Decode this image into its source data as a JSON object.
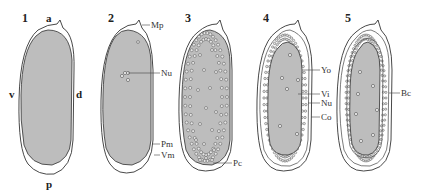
{
  "figure": {
    "panels": [
      {
        "number": "1",
        "axis_labels": {
          "anterior": "a",
          "posterior": "p",
          "ventral": "v",
          "dorsal": "d"
        },
        "labels": []
      },
      {
        "number": "2",
        "labels": [
          "Mp",
          "Nu",
          "Pm",
          "Vm"
        ]
      },
      {
        "number": "3",
        "labels": [
          "Pc"
        ]
      },
      {
        "number": "4",
        "labels": [
          "Yo",
          "Vi",
          "Nu",
          "Co"
        ]
      },
      {
        "number": "5",
        "labels": [
          "Bc"
        ]
      }
    ]
  },
  "colors": {
    "yolk": "#bdbdbd",
    "outline": "#333333",
    "background": "#ffffff"
  }
}
